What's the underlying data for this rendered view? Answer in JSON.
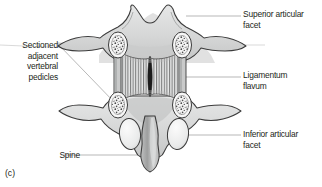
{
  "figure": {
    "panel_letter": "(c)",
    "labels": {
      "superior_articular_facet": "Superior articular\nfacet",
      "ligamentum_flavum": "Ligamentum\nflavum",
      "inferior_articular_facet": "Inferior articular\nfacet",
      "sectioned_pedicles": "Sectioned\nadjacent\nvertebral\npedicles",
      "spine": "Spine"
    },
    "colors": {
      "background": "#ffffff",
      "bone_fill": "#d7d8d8",
      "bone_fill_light": "#e8e9e9",
      "bone_outline": "#3b3b3b",
      "ligament_fill": "#e3e4e4",
      "ligament_striation": "#6b6c6c",
      "pedicle_fill": "#f1f1f1",
      "facet_fill": "#ececec",
      "leader_line": "#8c8c8c",
      "text": "#231f20",
      "shadow": "#b5b6b6"
    },
    "icon_names": {
      "superior_leader": "leader-line-icon",
      "ligamentum_leader": "leader-line-icon",
      "inferior_leader": "leader-line-icon",
      "sectioned_leader": "leader-line-icon",
      "spine_leader": "leader-line-icon"
    },
    "anatomy_parts": [
      "superior articular facet",
      "inferior articular facet",
      "ligamentum flavum",
      "sectioned adjacent vertebral pedicles",
      "spinous process (spine)",
      "transverse process",
      "lamina"
    ]
  }
}
